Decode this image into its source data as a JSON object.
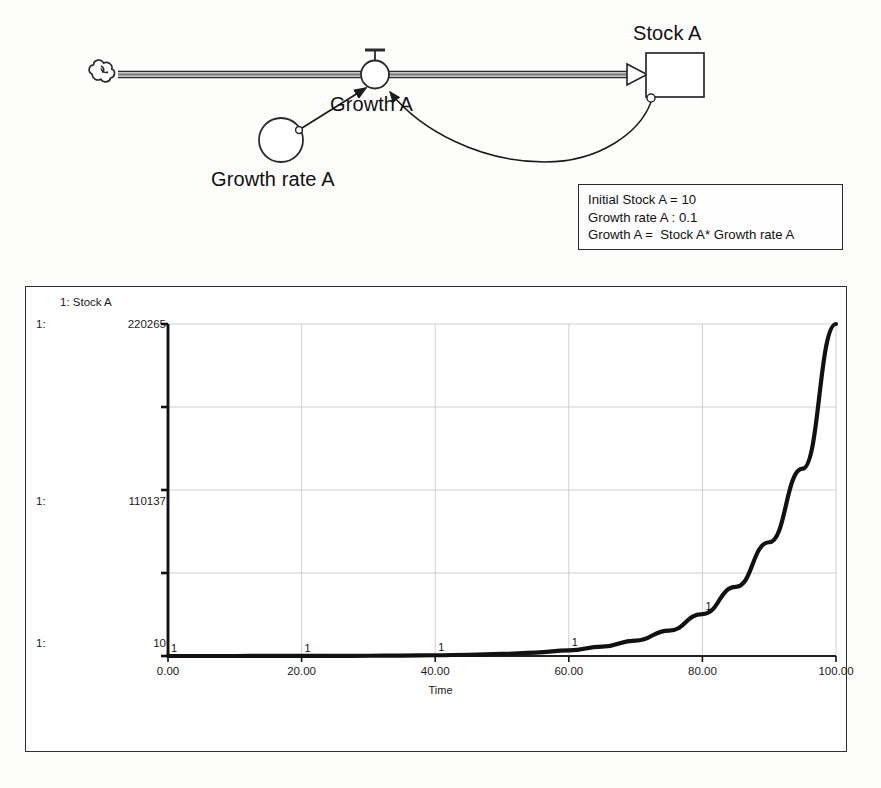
{
  "diagram": {
    "title_labels": {
      "stock": "Stock A",
      "flow": "Growth A",
      "converter": "Growth rate A"
    },
    "icons": {
      "source_cloud": "cloud-icon",
      "valve": "valve-icon",
      "stock_box": "stock-box-icon",
      "converter_circle": "converter-circle-icon",
      "flow_arrow": "flow-arrow-icon",
      "feedback_link": "feedback-link-icon"
    },
    "equations": {
      "line1": "Initial Stock A = 10",
      "line2": "Growth rate A : 0.1",
      "line3": "Growth A =  Stock A* Growth rate A"
    }
  },
  "chart_data": {
    "type": "line",
    "title": "",
    "legend": "1: Stock A",
    "legend_position": "top-left",
    "grid": true,
    "series_index_label": "1:",
    "series": [
      {
        "name": "Stock A",
        "marker": "1",
        "x": [
          0,
          5,
          10,
          15,
          20,
          25,
          30,
          35,
          40,
          45,
          50,
          55,
          60,
          65,
          70,
          75,
          80,
          85,
          90,
          95,
          100
        ],
        "values": [
          10,
          16,
          26,
          43,
          70,
          115,
          190,
          313,
          515,
          848,
          1397,
          2300,
          3787,
          6236,
          10267,
          16906,
          27837,
          45833,
          75463,
          124264,
          220265
        ]
      }
    ],
    "xlabel": "Time",
    "ylabel": "",
    "xlim": [
      0,
      100
    ],
    "ylim": [
      10,
      220265
    ],
    "xticks": [
      "0.00",
      "20.00",
      "40.00",
      "60.00",
      "80.00",
      "100.00"
    ],
    "xtick_values": [
      0,
      20,
      40,
      60,
      80,
      100
    ],
    "yticks_labeled": [
      "220265",
      "110137",
      "10"
    ],
    "ytick_values": [
      220265,
      110137,
      10
    ],
    "ytick_count": 5,
    "marker_x_positions": [
      0,
      20,
      40,
      60,
      80
    ],
    "colors": {
      "series_line": "#111111",
      "grid": "#c9c9c9",
      "axis": "#111111",
      "panel_border": "#2f2f2f",
      "background": "#ffffff"
    }
  }
}
